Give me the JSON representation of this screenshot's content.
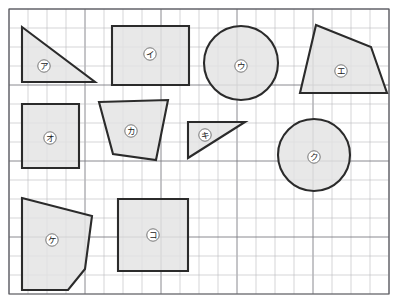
{
  "page": {
    "background_color": "#ffffff",
    "width": 400,
    "height": 298
  },
  "grid": {
    "name": "square-grid",
    "cell_size": 19,
    "origin_x": 9,
    "origin_y": 9,
    "cols": 20,
    "rows": 15,
    "minor_color": "#b9b9bd",
    "major_color": "#7d7d84",
    "major_every": 4,
    "frame_color": "#5a5a60"
  },
  "style": {
    "shape_fill": "#e3e3e3",
    "shape_stroke": "#2b2b2b",
    "shape_stroke_width": 2.1,
    "label_bubble_fill": "#ffffff",
    "label_text_color": "#1a1a1a"
  },
  "shapes": [
    {
      "id": "shape-a",
      "label": "ア",
      "kind": "triangle",
      "points": "22,27 22,82 95,82",
      "label_x": 44,
      "label_y": 66
    },
    {
      "id": "shape-i",
      "label": "イ",
      "kind": "rectangle",
      "points": "112,26 189,26 189,85 112,85",
      "label_x": 150,
      "label_y": 54
    },
    {
      "id": "shape-u",
      "label": "ウ",
      "kind": "circle",
      "cx": 241,
      "cy": 63,
      "r": 37,
      "label_x": 241,
      "label_y": 66
    },
    {
      "id": "shape-e",
      "label": "エ",
      "kind": "quadrilateral",
      "points": "316,25 371,47 387,93 300,93",
      "label_x": 341,
      "label_y": 71
    },
    {
      "id": "shape-o",
      "label": "オ",
      "kind": "rectangle",
      "points": "22,104 79,104 79,168 22,168",
      "label_x": 50,
      "label_y": 138
    },
    {
      "id": "shape-ka",
      "label": "カ",
      "kind": "trapezoid",
      "points": "99,102 168,100 156,160 113,154",
      "label_x": 131,
      "label_y": 131
    },
    {
      "id": "shape-ki",
      "label": "キ",
      "kind": "triangle",
      "points": "188,122 245,122 188,158",
      "label_x": 205,
      "label_y": 135
    },
    {
      "id": "shape-ku",
      "label": "ク",
      "kind": "circle",
      "cx": 314,
      "cy": 155,
      "r": 36,
      "label_x": 314,
      "label_y": 157
    },
    {
      "id": "shape-ke",
      "label": "ケ",
      "kind": "pentagon",
      "points": "22,198 92,216 85,269 68,290 22,290",
      "label_x": 52,
      "label_y": 240
    },
    {
      "id": "shape-ko",
      "label": "コ",
      "kind": "square",
      "points": "118,199 188,199 188,271 118,271",
      "label_x": 153,
      "label_y": 235
    }
  ]
}
